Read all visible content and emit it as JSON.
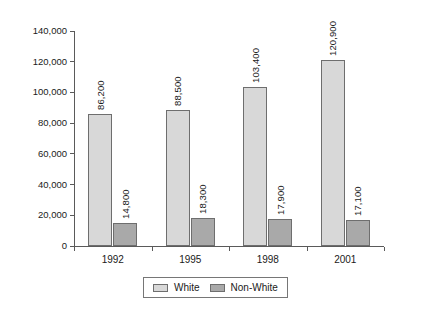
{
  "chart_data": {
    "type": "bar",
    "title": "",
    "subtitle": "",
    "xlabel": "",
    "ylabel": "",
    "categories": [
      "1992",
      "1995",
      "1998",
      "2001"
    ],
    "series": [
      {
        "name": "White",
        "color": "#d8d8d8",
        "values": [
          86200,
          88500,
          103400,
          120900
        ],
        "labels": [
          "86,200",
          "88,500",
          "103,400",
          "120,900"
        ]
      },
      {
        "name": "Non-White",
        "color": "#a9a9a9",
        "values": [
          14800,
          18300,
          17900,
          17100
        ],
        "labels": [
          "14,800",
          "18,300",
          "17,900",
          "17,100"
        ]
      }
    ],
    "ylim": [
      0,
      140000
    ],
    "ytick_values": [
      0,
      20000,
      40000,
      60000,
      80000,
      100000,
      120000,
      140000
    ],
    "ytick_labels": [
      "0",
      "20,000",
      "40,000",
      "60,000",
      "80,000",
      "100,000",
      "120,000",
      "140,000"
    ],
    "grid": false,
    "legend_position": "bottom",
    "legend_entries": [
      "White",
      "Non-White"
    ],
    "value_label_rotation": -90
  }
}
